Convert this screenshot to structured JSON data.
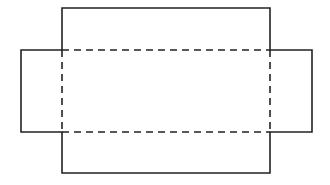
{
  "diagram": {
    "type": "box-net",
    "colors": {
      "line": "#222222",
      "background": "#ffffff"
    },
    "outline_points": [
      [
        62,
        8
      ],
      [
        270,
        8
      ],
      [
        270,
        50
      ],
      [
        312,
        50
      ],
      [
        312,
        132
      ],
      [
        270,
        132
      ],
      [
        270,
        173
      ],
      [
        62,
        173
      ],
      [
        62,
        132
      ],
      [
        21,
        132
      ],
      [
        21,
        50
      ],
      [
        62,
        50
      ]
    ],
    "fold_lines": [
      {
        "x1": 62,
        "y1": 50,
        "x2": 270,
        "y2": 50
      },
      {
        "x1": 62,
        "y1": 132,
        "x2": 270,
        "y2": 132
      },
      {
        "x1": 62,
        "y1": 50,
        "x2": 62,
        "y2": 132
      },
      {
        "x1": 270,
        "y1": 50,
        "x2": 270,
        "y2": 132
      }
    ]
  }
}
